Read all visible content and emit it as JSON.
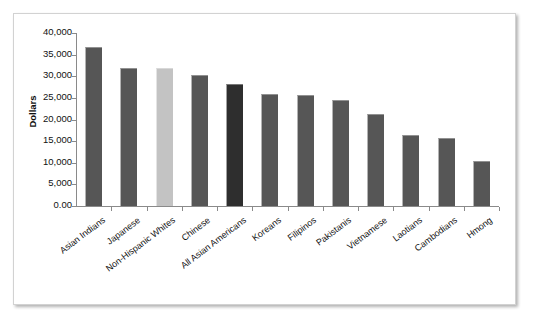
{
  "figure": {
    "y_axis_title": "Dollars",
    "y_tick_labels": [
      "40,000",
      "35,000",
      "30,000",
      "25,000",
      "20,000",
      "15,000",
      "10,000",
      "5,000",
      "0.00"
    ]
  },
  "chart_data": {
    "type": "bar",
    "title": "",
    "subtitle": "",
    "xlabel": "",
    "ylabel": "Dollars",
    "ylim": [
      0,
      40000
    ],
    "ytick_values": [
      0,
      5000,
      10000,
      15000,
      20000,
      25000,
      30000,
      35000,
      40000
    ],
    "ytick_labels": [
      "0.00",
      "5,000",
      "10,000",
      "15,000",
      "20,000",
      "25,000",
      "30,000",
      "35,000",
      "40,000"
    ],
    "grid": false,
    "legend": "none",
    "categories": [
      "Asian Indians",
      "Japanese",
      "Non-Hispanic Whites",
      "Chinese",
      "All Asian Americans",
      "Koreans",
      "Filipinos",
      "Pakistanis",
      "Vietnamese",
      "Laotians",
      "Cambodians",
      "Hmong"
    ],
    "values": [
      36750,
      31850,
      31800,
      30400,
      28300,
      26000,
      25600,
      24600,
      21200,
      16400,
      15800,
      10500
    ],
    "bar_colors": [
      "#565656",
      "#565656",
      "#c3c3c3",
      "#565656",
      "#2e2e2e",
      "#565656",
      "#565656",
      "#565656",
      "#565656",
      "#565656",
      "#565656",
      "#565656"
    ]
  }
}
